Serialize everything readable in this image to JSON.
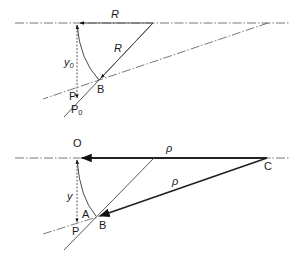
{
  "figure": {
    "top": {
      "labels": {
        "radius_horizontal": "R",
        "radius_slanted": "R",
        "offset": "y",
        "offset_sub": "0",
        "point_b": "B",
        "point_p": "P",
        "point_p0": "P",
        "point_p0_sub": "0"
      }
    },
    "bottom": {
      "labels": {
        "origin": "O",
        "rho_horizontal": "ρ",
        "rho_slanted": "ρ",
        "offset": "y",
        "point_a": "A",
        "point_b": "B",
        "point_p": "P",
        "point_c": "C"
      }
    }
  }
}
